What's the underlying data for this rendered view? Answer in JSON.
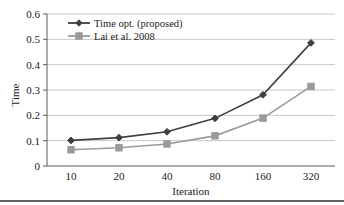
{
  "chart_data": {
    "type": "line",
    "title": "",
    "xlabel": "Iteration",
    "ylabel": "Time",
    "categories": [
      "10",
      "20",
      "40",
      "80",
      "160",
      "320"
    ],
    "x": [
      10,
      20,
      40,
      80,
      160,
      320
    ],
    "xscale": "category",
    "ylim": [
      0,
      0.6
    ],
    "yticks": [
      "0",
      "0.1",
      "0.2",
      "0.3",
      "0.4",
      "0.5",
      "0.6"
    ],
    "ytick_values": [
      0,
      0.1,
      0.2,
      0.3,
      0.4,
      0.5,
      0.6
    ],
    "grid": "horizontal",
    "legend_position": "top-left-inside",
    "series": [
      {
        "name": "Time opt. (proposed)",
        "marker": "diamond",
        "color": "#3f3f3f",
        "values": [
          0.101,
          0.112,
          0.135,
          0.188,
          0.281,
          0.486
        ]
      },
      {
        "name": "Lai et al. 2008",
        "marker": "square",
        "color": "#9a9a9a",
        "values": [
          0.064,
          0.072,
          0.087,
          0.119,
          0.189,
          0.314
        ]
      }
    ]
  },
  "style": {
    "background": "#ffffff",
    "grid_color": "#b9b9b9",
    "axis_color": "#5a5a5a",
    "rule_color": "#2b2b2b"
  }
}
